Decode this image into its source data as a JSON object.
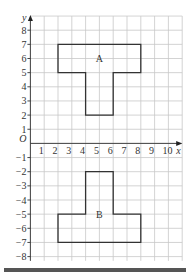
{
  "diagram": {
    "type": "coordinate-grid",
    "axes": {
      "x_label": "x",
      "y_label": "y",
      "origin_label": "O",
      "x_ticks": [
        "1",
        "2",
        "3",
        "4",
        "5",
        "6",
        "7",
        "8",
        "9",
        "10"
      ],
      "y_ticks_positive": [
        "1",
        "2",
        "3",
        "4",
        "5",
        "6",
        "7",
        "8"
      ],
      "y_ticks_negative": [
        "−1",
        "−2",
        "−3",
        "−4",
        "−5",
        "−6",
        "−7",
        "−8"
      ]
    },
    "shapes": [
      {
        "label": "A",
        "vertices": [
          [
            2,
            7
          ],
          [
            8,
            7
          ],
          [
            8,
            5
          ],
          [
            6,
            5
          ],
          [
            6,
            2
          ],
          [
            4,
            2
          ],
          [
            4,
            5
          ],
          [
            2,
            5
          ]
        ],
        "label_pos": [
          5,
          6
        ]
      },
      {
        "label": "B",
        "vertices": [
          [
            4,
            -2
          ],
          [
            6,
            -2
          ],
          [
            6,
            -5
          ],
          [
            8,
            -5
          ],
          [
            8,
            -7
          ],
          [
            2,
            -7
          ],
          [
            2,
            -5
          ],
          [
            4,
            -5
          ]
        ],
        "label_pos": [
          5,
          -5
        ]
      }
    ],
    "colors": {
      "grid": "#c8c8c8",
      "axis": "#333333",
      "shape": "#333333"
    }
  }
}
